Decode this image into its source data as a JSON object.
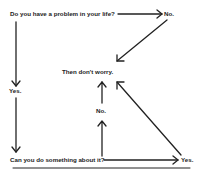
{
  "diagram": {
    "nodes": {
      "question1": "Do you have a problem in your life?",
      "no1": "No.",
      "then": "Then don't worry.",
      "yes1": "Yes.",
      "question2": "Can you do something about it?",
      "no2": "No.",
      "yes2": "Yes."
    },
    "edges": [
      {
        "from": "question1",
        "to": "no1"
      },
      {
        "from": "no1",
        "to": "then"
      },
      {
        "from": "question1",
        "to": "yes1"
      },
      {
        "from": "yes1",
        "to": "question2"
      },
      {
        "from": "question2",
        "to": "no2"
      },
      {
        "from": "no2",
        "to": "then"
      },
      {
        "from": "question2",
        "to": "yes2"
      },
      {
        "from": "yes2",
        "to": "then"
      }
    ],
    "colors": {
      "ink": "#222222",
      "background": "#ffffff"
    }
  }
}
